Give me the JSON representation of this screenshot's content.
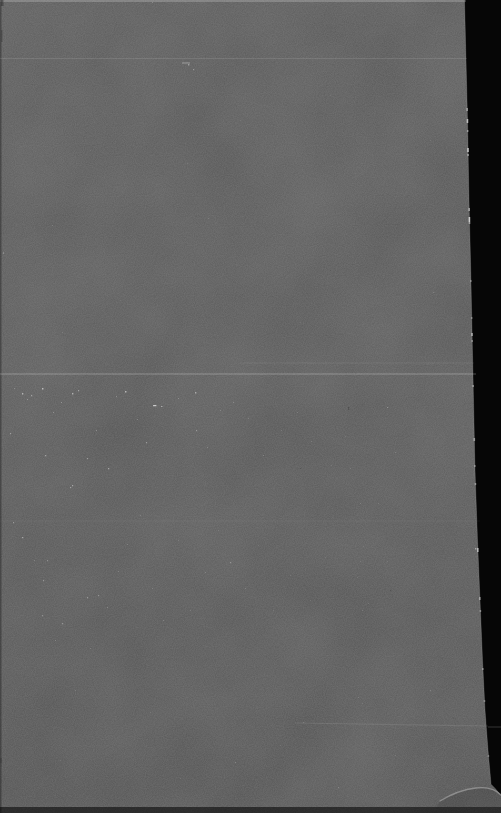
{
  "scene": {
    "description": "Photograph of a blank dark gray page on a black background; the page's right edge slants outward toward the bottom, the bottom-right corner is slightly curled with a highlight arc, and the surface shows film grain, dust specks and faint horizontal scratch lines",
    "width": 501,
    "height": 813
  },
  "palette": {
    "background": "#060606",
    "page_top": "#575757",
    "page_mid": "#565656",
    "page_bottom": "#525252",
    "edge_highlight": "#b5b5b5",
    "glint": "#e9e9e9",
    "speck": "#e6e6e6",
    "dark_speck": "#2e2e2e",
    "scratch": "#ffffff",
    "background_scratch": "#3a3a3a",
    "bottom_band": "#000000",
    "top_edge_line": "#ffffff"
  },
  "page": {
    "right_edge": [
      [
        464.5,
        0
      ],
      [
        466,
        60
      ],
      [
        467.5,
        120
      ],
      [
        469,
        200
      ],
      [
        470.5,
        260
      ],
      [
        472,
        330
      ],
      [
        473.5,
        400
      ],
      [
        475,
        470
      ],
      [
        477.5,
        540
      ],
      [
        480,
        600
      ],
      [
        482.5,
        660
      ],
      [
        485,
        710
      ],
      [
        488,
        750
      ],
      [
        490.5,
        778
      ],
      [
        491,
        784
      ]
    ],
    "curl_outline": [
      [
        495,
        788
      ],
      [
        501,
        795
      ]
    ],
    "curl_highlight": "M440,801 Q458,790 476,788 Q492,786 501,795",
    "curl_shadow": "M440,801 Q458,790 476,788 Q492,786 501,795 L501,807 L436,807 Z",
    "top_highlight": {
      "width": 466,
      "height": 2,
      "opacity": 0.2
    },
    "left_shadow": {
      "width": 1.5,
      "opacity": 0.3
    },
    "bottom_band": {
      "y": 807,
      "height": 6,
      "opacity": 0.55
    }
  },
  "streaks": [
    {
      "y": 58.5,
      "x1": 0,
      "x2": 467,
      "opacity": 0.1,
      "width": 1
    },
    {
      "y": 63,
      "x1": 182,
      "x2": 190,
      "opacity": 0.3,
      "width": 1.2
    },
    {
      "y": 363,
      "x1": 240,
      "x2": 474,
      "opacity": 0.07,
      "width": 1
    },
    {
      "y": 374,
      "x1": 0,
      "x2": 476,
      "opacity": 0.18,
      "width": 1.3
    },
    {
      "y": 521,
      "x1": 0,
      "x2": 480,
      "opacity": 0.04,
      "width": 1
    },
    {
      "y": 723,
      "y2": 726,
      "x1": 295,
      "x2": 488,
      "opacity": 0.09,
      "width": 1
    }
  ],
  "background_streak": {
    "y": 727,
    "x1": 488,
    "x2": 501,
    "opacity": 0.9,
    "width": 1
  },
  "edge_glints": [
    [
      108,
      3,
      0.5
    ],
    [
      119,
      4,
      0.7
    ],
    [
      130,
      2,
      0.45
    ],
    [
      148,
      4,
      0.75
    ],
    [
      154,
      2,
      0.5
    ],
    [
      208,
      3,
      0.55
    ],
    [
      217,
      5,
      0.8
    ],
    [
      222,
      2,
      0.5
    ],
    [
      280,
      2,
      0.35
    ],
    [
      317,
      2,
      0.35
    ],
    [
      333,
      3,
      0.6
    ],
    [
      340,
      2,
      0.4
    ],
    [
      385,
      2,
      0.45
    ],
    [
      438,
      3,
      0.5
    ],
    [
      465,
      2,
      0.4
    ],
    [
      483,
      2,
      0.45
    ],
    [
      548,
      4,
      0.65
    ],
    [
      597,
      3,
      0.5
    ],
    [
      610,
      2,
      0.4
    ],
    [
      668,
      2,
      0.4
    ],
    [
      700,
      2,
      0.35
    ],
    [
      755,
      2,
      0.3
    ]
  ],
  "specks": [
    [
      152,
      2,
      1,
      1,
      0.35
    ],
    [
      188,
      64,
      1.4,
      1.4,
      0.5
    ],
    [
      193,
      69,
      1.2,
      1.2,
      0.45
    ],
    [
      52,
      225,
      1,
      1,
      0.25
    ],
    [
      3,
      252,
      1,
      2,
      0.3
    ],
    [
      240,
      120,
      1,
      1,
      0.15
    ],
    [
      330,
      95,
      1,
      1,
      0.15
    ],
    [
      90,
      150,
      1,
      1,
      0.15
    ],
    [
      187,
      163,
      1,
      1,
      0.2
    ],
    [
      208,
      218,
      1.2,
      1,
      0.2
    ],
    [
      395,
      255,
      1,
      1,
      0.15
    ],
    [
      120,
      300,
      1,
      1,
      0.15
    ],
    [
      62,
      332,
      1,
      1,
      0.2
    ],
    [
      300,
      322,
      1,
      1,
      0.12
    ],
    [
      430,
      140,
      1,
      1,
      0.18
    ],
    [
      433,
      292,
      1.5,
      1,
      0.22
    ],
    [
      10,
      433,
      1.2,
      1.2,
      0.5
    ],
    [
      14,
      388,
      1,
      1,
      0.4
    ],
    [
      22,
      393,
      1.4,
      1.4,
      0.65
    ],
    [
      27,
      399,
      1,
      1,
      0.45
    ],
    [
      31,
      395,
      1.2,
      1.2,
      0.55
    ],
    [
      42,
      388,
      1.5,
      1.5,
      0.75
    ],
    [
      45,
      455,
      1.3,
      1.3,
      0.55
    ],
    [
      53,
      412,
      1,
      1,
      0.4
    ],
    [
      61,
      402,
      1,
      1,
      0.45
    ],
    [
      70,
      487,
      1.2,
      1.2,
      0.5
    ],
    [
      72,
      393,
      1.4,
      1.4,
      0.65
    ],
    [
      78,
      390,
      1.2,
      1.2,
      0.55
    ],
    [
      87,
      458,
      1.2,
      1.2,
      0.5
    ],
    [
      96,
      430,
      1,
      1,
      0.4
    ],
    [
      108,
      468,
      1.3,
      1.3,
      0.55
    ],
    [
      116,
      396,
      1,
      1,
      0.4
    ],
    [
      125,
      391,
      1.5,
      1.5,
      0.7
    ],
    [
      137,
      419,
      1,
      1,
      0.35
    ],
    [
      146,
      442,
      1.2,
      1.2,
      0.45
    ],
    [
      153,
      405,
      3.5,
      1.2,
      0.8
    ],
    [
      161,
      406,
      1.5,
      1,
      0.6
    ],
    [
      178,
      398,
      1,
      1,
      0.35
    ],
    [
      195,
      392,
      1.4,
      1.4,
      0.6
    ],
    [
      196,
      430,
      1.2,
      1.2,
      0.45
    ],
    [
      207,
      447,
      1,
      1,
      0.35
    ],
    [
      220,
      410,
      1,
      1,
      0.3
    ],
    [
      233,
      402,
      1,
      1,
      0.35
    ],
    [
      248,
      418,
      1,
      1,
      0.28
    ],
    [
      263,
      455,
      1,
      1,
      0.28
    ],
    [
      281,
      430,
      1,
      1,
      0.22
    ],
    [
      297,
      412,
      1,
      1,
      0.25
    ],
    [
      311,
      441,
      1,
      1,
      0.22
    ],
    [
      331,
      465,
      1,
      1,
      0.2
    ],
    [
      360,
      503,
      1,
      1,
      0.25
    ],
    [
      378,
      503,
      1,
      1,
      0.25
    ],
    [
      387,
      407,
      1.4,
      1,
      0.4
    ],
    [
      395,
      452,
      1,
      1,
      0.28
    ],
    [
      350,
      468,
      1,
      1,
      0.25
    ],
    [
      345,
      436,
      1,
      1,
      0.2
    ],
    [
      13,
      522,
      1.2,
      1.2,
      0.45
    ],
    [
      22,
      537,
      1.3,
      1.3,
      0.55
    ],
    [
      34,
      560,
      1,
      1,
      0.3
    ],
    [
      43,
      580,
      1.2,
      1.2,
      0.45
    ],
    [
      47,
      560,
      1.2,
      1.2,
      0.4
    ],
    [
      55,
      640,
      1,
      1,
      0.3
    ],
    [
      62,
      623,
      1.2,
      1.2,
      0.45
    ],
    [
      72,
      485,
      1.3,
      1.3,
      0.55
    ],
    [
      87,
      597,
      1.2,
      1.2,
      0.45
    ],
    [
      98,
      595,
      1.2,
      1.2,
      0.4
    ],
    [
      107,
      607,
      1,
      1,
      0.35
    ],
    [
      118,
      571,
      1,
      1,
      0.3
    ],
    [
      127,
      544,
      1,
      1,
      0.32
    ],
    [
      140,
      515,
      1,
      1,
      0.28
    ],
    [
      152,
      588,
      1,
      1,
      0.28
    ],
    [
      163,
      620,
      1,
      1,
      0.3
    ],
    [
      178,
      540,
      1,
      1,
      0.22
    ],
    [
      190,
      610,
      1,
      1,
      0.22
    ],
    [
      205,
      572,
      1,
      1,
      0.26
    ],
    [
      218,
      530,
      1,
      1,
      0.22
    ],
    [
      230,
      562,
      1.3,
      1.3,
      0.38
    ],
    [
      245,
      588,
      1,
      1,
      0.26
    ],
    [
      258,
      545,
      1,
      1,
      0.2
    ],
    [
      273,
      610,
      1,
      1,
      0.18
    ],
    [
      290,
      575,
      1,
      1,
      0.18
    ],
    [
      310,
      600,
      1,
      1,
      0.18
    ],
    [
      325,
      557,
      1,
      1,
      0.16
    ],
    [
      42,
      615,
      1.2,
      1.2,
      0.4
    ],
    [
      90,
      648,
      1,
      1,
      0.22
    ],
    [
      363,
      546,
      1,
      1,
      0.2
    ],
    [
      360,
      561,
      1,
      1,
      0.2
    ],
    [
      387,
      561,
      1,
      1,
      0.18
    ],
    [
      357,
      577,
      1,
      1,
      0.18
    ],
    [
      368,
      603,
      1,
      1,
      0.2
    ],
    [
      362,
      610,
      1,
      1,
      0.18
    ],
    [
      475,
      548,
      1.5,
      1.5,
      0.55
    ],
    [
      75,
      690,
      1,
      1,
      0.2
    ],
    [
      150,
      712,
      1,
      1,
      0.2
    ],
    [
      235,
      762,
      1.2,
      1.2,
      0.3
    ],
    [
      303,
      722,
      1,
      1,
      0.25
    ],
    [
      358,
      697,
      1,
      1,
      0.22
    ],
    [
      362,
      703,
      1,
      1,
      0.2
    ],
    [
      338,
      787,
      1.2,
      1.2,
      0.28
    ],
    [
      395,
      755,
      1,
      1,
      0.2
    ],
    [
      430,
      690,
      1.2,
      1.2,
      0.25
    ],
    [
      180,
      778,
      1,
      1,
      0.18
    ],
    [
      60,
      760,
      1,
      1,
      0.18
    ],
    [
      280,
      745,
      1,
      1,
      0.15
    ]
  ],
  "dark_specks": [
    [
      348,
      407,
      1.2,
      3,
      0.35
    ],
    [
      300,
      468,
      1,
      1,
      0.25
    ],
    [
      390,
      590,
      1.2,
      1.2,
      0.3
    ],
    [
      330,
      270,
      1,
      1,
      0.2
    ],
    [
      1,
      0,
      2.5,
      6,
      0.5
    ],
    [
      1,
      30,
      1.5,
      12,
      0.35
    ],
    [
      0,
      758,
      2,
      5,
      0.3
    ]
  ]
}
